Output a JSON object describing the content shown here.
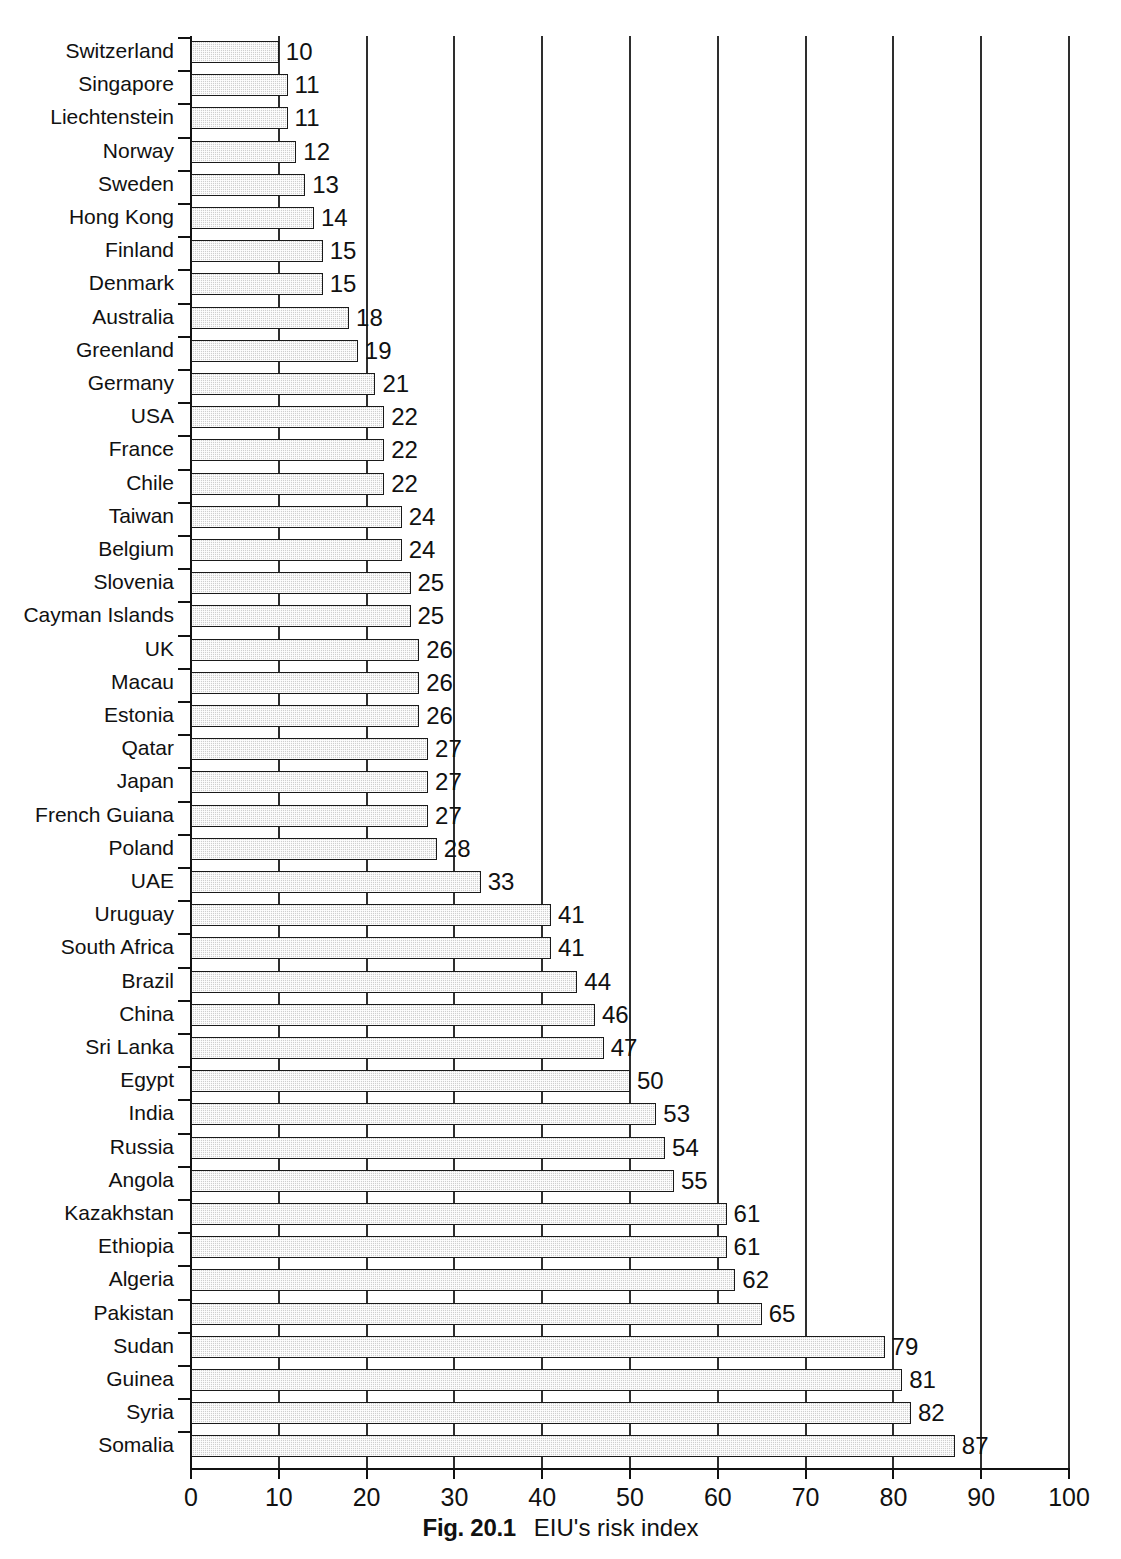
{
  "caption": {
    "figure_number": "Fig. 20.1",
    "figure_text": "EIU's risk index"
  },
  "chart_data": {
    "type": "bar",
    "orientation": "horizontal",
    "title": "EIU's risk index",
    "xlabel": "",
    "ylabel": "",
    "xlim": [
      0,
      100
    ],
    "xticks": [
      0,
      10,
      20,
      30,
      40,
      50,
      60,
      70,
      80,
      90,
      100
    ],
    "xtick_labels": [
      "0",
      "10",
      "20",
      "30",
      "40",
      "50",
      "60",
      "70",
      "80",
      "90",
      "100"
    ],
    "grid": true,
    "grid_axis": "x",
    "legend": false,
    "bar_fill": "#cfcfcf",
    "bar_edge": "#1a1a1a",
    "categories": [
      "Switzerland",
      "Singapore",
      "Liechtenstein",
      "Norway",
      "Sweden",
      "Hong Kong",
      "Finland",
      "Denmark",
      "Australia",
      "Greenland",
      "Germany",
      "USA",
      "France",
      "Chile",
      "Taiwan",
      "Belgium",
      "Slovenia",
      "Cayman Islands",
      "UK",
      "Macau",
      "Estonia",
      "Qatar",
      "Japan",
      "French Guiana",
      "Poland",
      "UAE",
      "Uruguay",
      "South Africa",
      "Brazil",
      "China",
      "Sri Lanka",
      "Egypt",
      "India",
      "Russia",
      "Angola",
      "Kazakhstan",
      "Ethiopia",
      "Algeria",
      "Pakistan",
      "Sudan",
      "Guinea",
      "Syria",
      "Somalia"
    ],
    "values": [
      10,
      11,
      11,
      12,
      13,
      14,
      15,
      15,
      18,
      19,
      21,
      22,
      22,
      22,
      24,
      24,
      25,
      25,
      26,
      26,
      26,
      27,
      27,
      27,
      28,
      33,
      41,
      41,
      44,
      46,
      47,
      50,
      53,
      54,
      55,
      61,
      61,
      62,
      65,
      79,
      81,
      82,
      87
    ],
    "value_labels": [
      "10",
      "11",
      "11",
      "12",
      "13",
      "14",
      "15",
      "15",
      "18",
      "19",
      "21",
      "22",
      "22",
      "22",
      "24",
      "24",
      "25",
      "25",
      "26",
      "26",
      "26",
      "27",
      "27",
      "27",
      "28",
      "33",
      "41",
      "41",
      "44",
      "46",
      "47",
      "50",
      "53",
      "54",
      "55",
      "61",
      "61",
      "62",
      "65",
      "79",
      "81",
      "82",
      "87"
    ]
  }
}
